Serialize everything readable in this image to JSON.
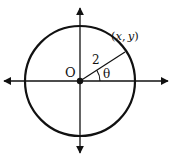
{
  "diagram": {
    "title": "",
    "type": "unit-circle-style coordinate diagram",
    "origin_label": "O",
    "radius_label": "2",
    "angle_label": "θ",
    "point_label": "(x, y)",
    "point_label_parts": {
      "open": "(",
      "x": "x",
      "comma": ",",
      "y": "y",
      "close": ")"
    },
    "colors": {
      "stroke": "#111111",
      "background": "#ffffff"
    },
    "geometry": {
      "center": [
        80,
        81
      ],
      "radius_px": 55,
      "point": [
        125,
        52
      ],
      "axes": {
        "x_from": 2,
        "x_to": 170,
        "y_from": 6,
        "y_to": 155
      }
    }
  }
}
